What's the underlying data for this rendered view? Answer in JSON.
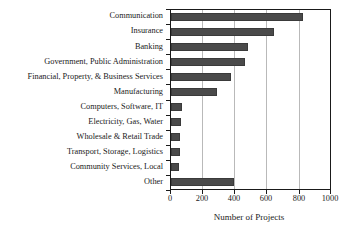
{
  "chart_data": {
    "type": "bar",
    "orientation": "horizontal",
    "title": "",
    "xlabel": "Number of Projects",
    "ylabel": "",
    "xlim": [
      0,
      1000
    ],
    "xticks": [
      0,
      200,
      400,
      600,
      800,
      1000
    ],
    "grid": "vertical",
    "legend": "none",
    "series_color": "#4a4a4a",
    "categories": [
      "Communication",
      "Insurance",
      "Banking",
      "Government, Public Administration",
      "Financial, Property, & Business Services",
      "Manufacturing",
      "Computers, Software, IT",
      "Electricity, Gas, Water",
      "Wholesale & Retail Trade",
      "Transport, Storage, Logistics",
      "Community Services, Local",
      "Other"
    ],
    "values": [
      823,
      645,
      480,
      465,
      375,
      290,
      70,
      62,
      58,
      56,
      50,
      395
    ]
  },
  "axis": {
    "x_title": "Number of Projects",
    "tick_labels": [
      "0",
      "200",
      "400",
      "600",
      "800",
      "1000"
    ]
  }
}
